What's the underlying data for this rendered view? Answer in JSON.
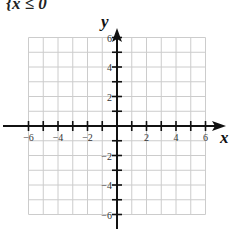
{
  "cut_text": "{x ≤ 0",
  "axes": {
    "x_label": "x",
    "y_label": "y",
    "x_ticks": [
      "-6",
      "-4",
      "-2",
      "2",
      "4",
      "6"
    ],
    "y_ticks": [
      "6",
      "4",
      "2",
      "-2",
      "-4",
      "-6"
    ],
    "range": [
      -6,
      6
    ]
  },
  "colors": {
    "grid": "#cccccc",
    "axis": "#111111"
  }
}
